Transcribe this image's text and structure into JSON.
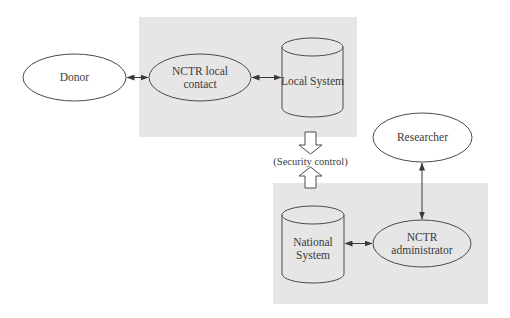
{
  "diagram": {
    "zones": {
      "local": {
        "name": "local-zone",
        "fill": "#e6e6e6"
      },
      "national": {
        "name": "national-zone",
        "fill": "#e6e6e6"
      }
    },
    "nodes": {
      "donor": {
        "label": "Donor",
        "shape": "ellipse"
      },
      "local_contact": {
        "line1": "NCTR local",
        "line2": "contact",
        "shape": "ellipse"
      },
      "local_system": {
        "label": "Local System",
        "shape": "cylinder"
      },
      "researcher": {
        "label": "Researcher",
        "shape": "ellipse"
      },
      "national_system": {
        "line1": "National",
        "line2": "System",
        "shape": "cylinder"
      },
      "administrator": {
        "line1": "NCTR",
        "line2": "administrator",
        "shape": "ellipse"
      }
    },
    "security": {
      "label": "(Security control)"
    },
    "edges": [
      {
        "from": "Donor",
        "to": "NCTR local contact",
        "type": "bidirectional"
      },
      {
        "from": "NCTR local contact",
        "to": "Local System",
        "type": "bidirectional"
      },
      {
        "from": "Local System",
        "to": "National System",
        "type": "hollow-arrows",
        "label": "(Security control)"
      },
      {
        "from": "Researcher",
        "to": "NCTR administrator",
        "type": "bidirectional"
      },
      {
        "from": "National System",
        "to": "NCTR administrator",
        "type": "bidirectional"
      }
    ],
    "colors": {
      "stroke": "#4a4a4a",
      "zone_fill": "#e6e6e6",
      "node_fill_in_zone": "#e6e6e6",
      "node_fill_outside": "#ffffff"
    }
  }
}
